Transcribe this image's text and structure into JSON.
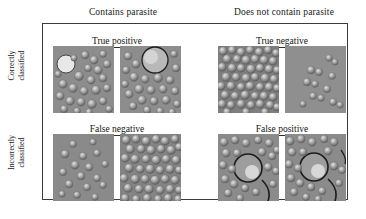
{
  "figure": {
    "type": "confusion-matrix-image-grid",
    "border_color": "#3b3b3b",
    "background_color": "#ffffff",
    "text_color": "#181818"
  },
  "columns": [
    {
      "key": "positive",
      "label": "Contains parasite"
    },
    {
      "key": "negative",
      "label": "Does not contain parasite"
    }
  ],
  "rows": [
    {
      "key": "correct",
      "label_line1": "Correctly",
      "label_line2": "classified"
    },
    {
      "key": "incorrect",
      "label_line1": "Incorrectly",
      "label_line2": "classified"
    }
  ],
  "quadrants": {
    "true_positive": {
      "title": "True positive",
      "row": "correct",
      "column": "positive",
      "tiles": [
        {
          "name": "true-positive-sample-1",
          "style": "dense-cells-with-large-bright-bubble-left"
        },
        {
          "name": "true-positive-sample-2",
          "style": "dense-cells-with-large-ringed-bubble-top"
        }
      ]
    },
    "true_negative": {
      "title": "True negative",
      "row": "correct",
      "column": "negative",
      "tiles": [
        {
          "name": "true-negative-sample-1",
          "style": "very-dense-uniform-cell-field"
        },
        {
          "name": "true-negative-sample-2",
          "style": "sparse-cells-on-flat-gray"
        }
      ]
    },
    "false_negative": {
      "title": "False negative",
      "row": "incorrect",
      "column": "positive",
      "tiles": [
        {
          "name": "false-negative-sample-1",
          "style": "sparse-cells-on-flat-gray"
        },
        {
          "name": "false-negative-sample-2",
          "style": "very-dense-uniform-cell-field"
        }
      ]
    },
    "false_positive": {
      "title": "False positive",
      "row": "incorrect",
      "column": "negative",
      "tiles": [
        {
          "name": "false-positive-sample-1",
          "style": "cells-with-large-dark-ringed-bubble"
        },
        {
          "name": "false-positive-sample-2",
          "style": "cells-with-large-dark-ringed-bubble"
        }
      ]
    }
  },
  "palette": {
    "tile_background": "#8b8b8b",
    "cell_light": "#d8d8d8",
    "cell_shadow": "#5a5a5a",
    "bubble_outline": "#262626",
    "bubble_highlight": "#eeeeee"
  }
}
